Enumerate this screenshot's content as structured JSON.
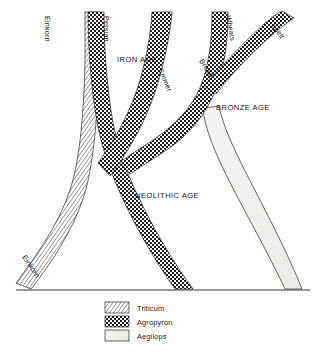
{
  "figure": {
    "domain": "diagram",
    "kind": "wheat-evolution-phylogeny",
    "background_color": "#ffffff",
    "line_color": "#2b2b2b"
  },
  "era_labels": [
    {
      "id": "iron-age",
      "text": "IRON AGE",
      "x": 117,
      "y": 62
    },
    {
      "id": "bronze-age",
      "text": "BRONZE AGE",
      "x": 216,
      "y": 110
    },
    {
      "id": "neolithic-age",
      "text": "NEOLITHIC AGE",
      "x": 135,
      "y": 198
    }
  ],
  "branch_labels": [
    {
      "id": "einkorn-top",
      "text": "Einkorn",
      "x": 45,
      "y": 16,
      "rotation": 90
    },
    {
      "id": "persian",
      "text": "Persian",
      "x": 104,
      "y": 16,
      "rotation": 90
    },
    {
      "id": "emmer",
      "text": "Emmer",
      "x": 160,
      "y": 72,
      "rotation": 66
    },
    {
      "id": "bread",
      "text": "Bread",
      "x": 200,
      "y": 62,
      "rotation": 56
    },
    {
      "id": "wheats",
      "text": "Wheats",
      "x": 224,
      "y": 15,
      "rotation": 80
    },
    {
      "id": "spelt",
      "text": "Spelt",
      "x": 270,
      "y": 24,
      "rotation": 56
    },
    {
      "id": "einkorn-bottom",
      "text": "Einkorn",
      "x": 24,
      "y": 258,
      "rotation": 56
    }
  ],
  "legend": {
    "items": [
      {
        "id": "triticum",
        "label": "Triticum",
        "pattern": "diagonal-hatch",
        "color": "#9a9a9a"
      },
      {
        "id": "agropyron",
        "label": "Agropyron",
        "pattern": "checkerboard",
        "color": "#2e2e2e"
      },
      {
        "id": "aegilops",
        "label": "Aegilops",
        "pattern": "plain-light",
        "color": "#f0f0ee"
      }
    ]
  },
  "bands": [
    {
      "id": "einkorn-triticum",
      "taxon": "Triticum",
      "pattern": "diagonal-hatch",
      "top_label": "Einkorn",
      "bottom_label": "Einkorn",
      "note": "ascends from baseline bottom-left to top of figure"
    },
    {
      "id": "persian-agropyron",
      "taxon": "Agropyron",
      "pattern": "checkerboard",
      "top_label": "Persian",
      "note": "descends from top to baseline, crossing the Einkorn band"
    },
    {
      "id": "emmer-agropyron",
      "taxon": "Agropyron",
      "pattern": "checkerboard",
      "top_label": "Emmer",
      "note": "branches downward-left joining the main Neolithic stem"
    },
    {
      "id": "bread-wheats-agropyron",
      "taxon": "Agropyron",
      "pattern": "checkerboard",
      "top_label": "Wheats",
      "side_label": "Bread",
      "note": "Bread wheats branch descending left to the Neolithic junction"
    },
    {
      "id": "spelt-agropyron",
      "taxon": "Agropyron",
      "pattern": "checkerboard",
      "top_label": "Spelt",
      "note": "diagonal branch ascending to the top right"
    },
    {
      "id": "aegilops-band",
      "taxon": "Aegilops",
      "pattern": "plain-light",
      "note": "light band emerging at Bronze Age, descending to bottom right baseline"
    }
  ],
  "baseline": {
    "id": "timeline-baseline",
    "x_start": 16,
    "x_end": 310,
    "y": 290
  }
}
